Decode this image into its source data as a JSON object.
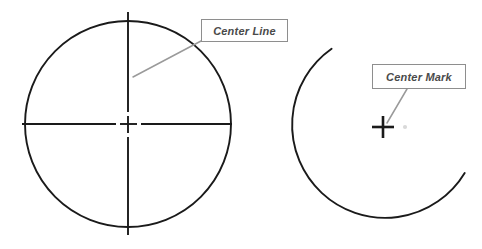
{
  "figure": {
    "background_color": "#ffffff",
    "width": 482,
    "height": 249
  },
  "style": {
    "geometry_stroke": "#1a1a1a",
    "centerline_stroke": "#1a1a1a",
    "leader_stroke": "#9a9a9a",
    "box_border": "#8e8e8e",
    "box_fill": "#ffffff",
    "label_text_color": "#4a4a4a",
    "faint_dot_color": "#d0d0d0"
  },
  "callouts": [
    {
      "id": "center-line",
      "label": "Center Line",
      "box": {
        "x": 201,
        "y": 19,
        "width": 87,
        "height": 23
      },
      "leader_from": {
        "x": 201,
        "y": 41
      },
      "leader_to": {
        "x": 133,
        "y": 77
      }
    },
    {
      "id": "center-mark",
      "label": "Center Mark",
      "box": {
        "x": 372,
        "y": 64,
        "width": 94,
        "height": 25
      },
      "leader_from": {
        "x": 407,
        "y": 89
      },
      "leader_to": {
        "x": 386,
        "y": 124
      }
    }
  ],
  "shapes": {
    "left_circle": {
      "name": "full-circle-with-center-lines",
      "center": {
        "x": 128,
        "y": 124
      },
      "radius": 103,
      "vertical_center_line": {
        "top": 12,
        "bottom": 235
      },
      "horizontal_center_line": {
        "left": 22,
        "right": 232
      },
      "center_gap": 12,
      "center_cross_arm": 9
    },
    "right_arc": {
      "name": "arc-with-center-mark",
      "center": {
        "x": 385,
        "y": 125
      },
      "radius": 93,
      "start_angle_deg": -125,
      "end_angle_deg": 31,
      "sweep_deg": 204,
      "center_mark": {
        "x": 383,
        "y": 127,
        "arm_length": 11
      },
      "faint_dot": {
        "x": 405,
        "y": 127,
        "radius": 2
      }
    }
  }
}
